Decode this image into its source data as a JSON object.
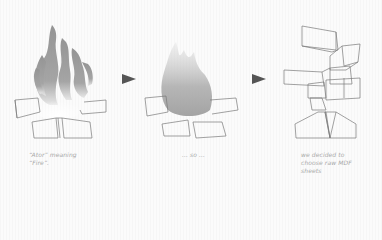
{
  "diagram": {
    "stages": [
      {
        "name": "burning-campfire",
        "caption_lines": [
          "“Ator” meaning",
          "“Fire”."
        ]
      },
      {
        "name": "smoke-campfire",
        "caption_lines": [
          "... so ..."
        ]
      },
      {
        "name": "stacked-mdf-blocks",
        "caption_lines": [
          "we decided to",
          "choose raw MDF",
          "sheets"
        ]
      }
    ],
    "arrows": [
      {
        "from": "burning-campfire",
        "to": "smoke-campfire"
      },
      {
        "from": "smoke-campfire",
        "to": "stacked-mdf-blocks"
      }
    ],
    "colors": {
      "line": "#7a7a7a",
      "arrow": "#555555",
      "flame_dark": "#6e6e6e",
      "flame_light": "#c8c8c8",
      "caption": "#a8a8a8"
    }
  }
}
